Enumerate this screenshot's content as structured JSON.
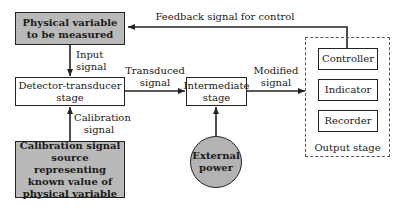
{
  "diagram": {
    "nodes": {
      "physical_variable": {
        "line1": "Physical variable",
        "line2": "to be measured"
      },
      "detector": {
        "line1": "Detector-transducer",
        "line2": "stage"
      },
      "calibration_source": {
        "line1": "Calibration signal",
        "line2": "source representing",
        "line3": "known value of",
        "line4": "physical variable"
      },
      "intermediate": {
        "line1": "Intermediate",
        "line2": "stage"
      },
      "external_power": {
        "line1": "External",
        "line2": "power"
      },
      "controller": "Controller",
      "indicator": "Indicator",
      "recorder": "Recorder",
      "output_stage": "Output stage"
    },
    "edges": {
      "feedback": "Feedback signal for control",
      "input": {
        "line1": "Input",
        "line2": "signal"
      },
      "transduced": {
        "line1": "Transduced",
        "line2": "signal"
      },
      "modified": {
        "line1": "Modified",
        "line2": "signal"
      },
      "calibration": {
        "line1": "Calibration",
        "line2": "signal"
      }
    },
    "colors": {
      "shaded_fill": "#b9b9b9",
      "circle_fill": "#b3b3b3",
      "line": "#222222"
    }
  }
}
